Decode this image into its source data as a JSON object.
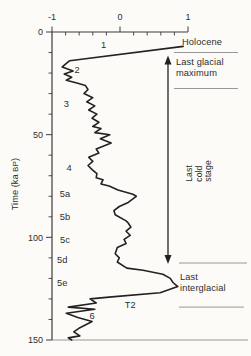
{
  "figure": {
    "width": 251,
    "height": 356,
    "background": "#fcfbf7",
    "curve_color": "#222222",
    "axis_color": "#3c3c3c",
    "rule_color": "#8c8c8c",
    "text_color": "#2e2e2e"
  },
  "chart_data": {
    "type": "line",
    "title": "",
    "xlabel": "",
    "ylabel": "Time (ka BP)",
    "ylabel_parts": {
      "pre": "Time (ka ",
      "sc": "BP",
      "post": ")"
    },
    "x_axis": {
      "position": "top",
      "range": [
        -1,
        1
      ],
      "ticks": [
        "-1",
        "0",
        "1"
      ],
      "tick_values": [
        -1,
        0,
        1
      ],
      "minor_values": [
        -0.8,
        -0.6,
        -0.4,
        -0.2,
        0.2,
        0.4,
        0.6,
        0.8
      ]
    },
    "y_axis": {
      "position": "left",
      "direction": "down",
      "range": [
        0,
        150
      ],
      "ticks": [
        "0",
        "50",
        "100",
        "150"
      ],
      "tick_values": [
        0,
        50,
        100,
        150
      ],
      "minor_values": [
        10,
        20,
        30,
        40,
        60,
        70,
        80,
        90,
        110,
        120,
        130,
        140
      ]
    },
    "series": [
      {
        "name": "isotope curve",
        "points_format": "[time_ka, value]",
        "points": [
          [
            7,
            0.93
          ],
          [
            14,
            -0.74
          ],
          [
            17,
            -0.85
          ],
          [
            19,
            -0.69
          ],
          [
            20.5,
            -0.82
          ],
          [
            22,
            -0.71
          ],
          [
            23.5,
            -0.79
          ],
          [
            25,
            -0.62
          ],
          [
            26,
            -0.51
          ],
          [
            28,
            -0.47
          ],
          [
            30,
            -0.53
          ],
          [
            32,
            -0.4
          ],
          [
            34,
            -0.49
          ],
          [
            36,
            -0.37
          ],
          [
            38,
            -0.46
          ],
          [
            40,
            -0.34
          ],
          [
            42,
            -0.41
          ],
          [
            44,
            -0.31
          ],
          [
            46,
            -0.4
          ],
          [
            47,
            -0.28
          ],
          [
            49,
            -0.37
          ],
          [
            50,
            -0.15
          ],
          [
            52,
            -0.29
          ],
          [
            54,
            -0.13
          ],
          [
            57,
            -0.35
          ],
          [
            59,
            -0.31
          ],
          [
            61,
            -0.46
          ],
          [
            63,
            -0.4
          ],
          [
            65,
            -0.47
          ],
          [
            67,
            -0.41
          ],
          [
            69,
            -0.34
          ],
          [
            71,
            -0.35
          ],
          [
            72,
            -0.25
          ],
          [
            74,
            -0.28
          ],
          [
            75,
            -0.16
          ],
          [
            77,
            -0.03
          ],
          [
            79,
            0.19
          ],
          [
            80,
            0.24
          ],
          [
            83,
            0.12
          ],
          [
            85,
            -0.01
          ],
          [
            87,
            -0.09
          ],
          [
            89,
            -0.07
          ],
          [
            92,
            0.09
          ],
          [
            93,
            0.12
          ],
          [
            95,
            0.16
          ],
          [
            97,
            0.09
          ],
          [
            99,
            0.15
          ],
          [
            101,
            0.06
          ],
          [
            103,
            0.09
          ],
          [
            105,
            -0.04
          ],
          [
            108,
            -0.07
          ],
          [
            110,
            -0.01
          ],
          [
            112,
            -0.04
          ],
          [
            115,
            0.1
          ],
          [
            116,
            0.34
          ],
          [
            118,
            0.63
          ],
          [
            120,
            0.74
          ],
          [
            122,
            0.78
          ],
          [
            124,
            0.85
          ],
          [
            127,
            0.59
          ],
          [
            129,
            -0.12
          ],
          [
            130,
            -0.44
          ],
          [
            132,
            -0.35
          ],
          [
            134,
            -0.76
          ],
          [
            135,
            -0.37
          ],
          [
            137,
            -0.79
          ],
          [
            139,
            -0.62
          ],
          [
            141,
            -0.41
          ],
          [
            144,
            -0.59
          ],
          [
            146,
            -0.68
          ],
          [
            148,
            -0.59
          ],
          [
            149,
            -0.76
          ],
          [
            150,
            -0.71
          ]
        ]
      }
    ],
    "stage_labels": [
      {
        "text": "1",
        "t": 6,
        "v": -0.24
      },
      {
        "text": "2",
        "t": 18.5,
        "v": -0.63
      },
      {
        "text": "3",
        "t": 35,
        "v": -0.79
      },
      {
        "text": "4",
        "t": 66,
        "v": -0.75
      },
      {
        "text": "5a",
        "t": 79,
        "v": -0.81
      },
      {
        "text": "5b",
        "t": 90,
        "v": -0.81
      },
      {
        "text": "5c",
        "t": 101,
        "v": -0.81
      },
      {
        "text": "5d",
        "t": 111,
        "v": -0.85
      },
      {
        "text": "5e",
        "t": 122,
        "v": -0.85
      },
      {
        "text": "6",
        "t": 138,
        "v": -0.41
      },
      {
        "text": "T2",
        "t": 133,
        "v": 0.15
      }
    ],
    "annotations": {
      "holocene": {
        "label": "Holocene"
      },
      "last_glacial_maximum": {
        "label": "Last glacial maximum",
        "lines": [
          "Last glacial",
          "maximum"
        ]
      },
      "last_cold_stage": {
        "label": "Last cold stage",
        "lines": [
          "Last",
          "cold",
          "stage"
        ]
      },
      "last_interglacial": {
        "label": "Last interglacial",
        "lines": [
          "Last",
          "interglacial"
        ]
      }
    },
    "layout": {
      "plot": {
        "x_left": 52,
        "x_right": 188,
        "y_top": 32,
        "y_bottom": 340
      },
      "rules": [
        {
          "t": 10,
          "x1": 174,
          "x2": 238
        },
        {
          "t": 27.5,
          "x1": 174,
          "x2": 238
        },
        {
          "t": 112.5,
          "x1": 179,
          "x2": 247
        },
        {
          "t": 134,
          "x1": 179,
          "x2": 244
        },
        {
          "t": 150,
          "x1": 52,
          "x2": 248
        }
      ],
      "arrow": {
        "x": 168,
        "t_from": 11.5,
        "t_to": 113
      }
    }
  }
}
